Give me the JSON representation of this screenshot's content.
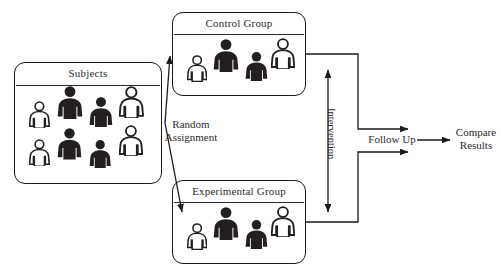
{
  "diagram": {
    "stroke_color": "#1a1a1a",
    "text_color": "#2b2b2b",
    "figure_fill_color": "#231f20",
    "figure_outline_color": "#231f20",
    "background_color": "#ffffff"
  },
  "boxes": [
    {
      "id": "subjects",
      "label": "Subjects",
      "x": 14,
      "y": 62,
      "width": 148,
      "height": 122,
      "divider_y": 22,
      "figures": [
        {
          "x": 14,
          "y": 38,
          "scale": 0.8,
          "style": "outline"
        },
        {
          "x": 42,
          "y": 22,
          "scale": 1.0,
          "style": "filled"
        },
        {
          "x": 74,
          "y": 33,
          "scale": 0.92,
          "style": "filled"
        },
        {
          "x": 104,
          "y": 23,
          "scale": 0.95,
          "style": "outline"
        },
        {
          "x": 14,
          "y": 76,
          "scale": 0.8,
          "style": "outline"
        },
        {
          "x": 42,
          "y": 64,
          "scale": 0.96,
          "style": "filled"
        },
        {
          "x": 74,
          "y": 76,
          "scale": 0.86,
          "style": "filled"
        },
        {
          "x": 104,
          "y": 62,
          "scale": 0.92,
          "style": "outline"
        }
      ]
    },
    {
      "id": "control-group",
      "label": "Control Group",
      "x": 172,
      "y": 12,
      "width": 134,
      "height": 84,
      "divider_y": 21,
      "figures": [
        {
          "x": 14,
          "y": 42,
          "scale": 0.78,
          "style": "outline"
        },
        {
          "x": 40,
          "y": 25,
          "scale": 1.0,
          "style": "filled"
        },
        {
          "x": 72,
          "y": 38,
          "scale": 0.88,
          "style": "filled"
        },
        {
          "x": 98,
          "y": 25,
          "scale": 0.92,
          "style": "outline"
        }
      ]
    },
    {
      "id": "experimental-group",
      "label": "Experimental Group",
      "x": 172,
      "y": 180,
      "width": 134,
      "height": 84,
      "divider_y": 21,
      "figures": [
        {
          "x": 14,
          "y": 42,
          "scale": 0.78,
          "style": "outline"
        },
        {
          "x": 40,
          "y": 25,
          "scale": 1.0,
          "style": "filled"
        },
        {
          "x": 72,
          "y": 38,
          "scale": 0.88,
          "style": "filled"
        },
        {
          "x": 98,
          "y": 25,
          "scale": 0.92,
          "style": "outline"
        }
      ]
    }
  ],
  "labels": {
    "random_assignment_line1": "Random",
    "random_assignment_line2": "Assignment",
    "intervention": "Intervention",
    "follow_up": "Follow Up",
    "compare_results_line1": "Compare",
    "compare_results_line2": "Results"
  }
}
